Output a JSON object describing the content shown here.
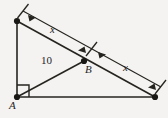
{
  "figure": {
    "background_color": "#f4f3f1",
    "stroke_color": "#26241f",
    "labels": {
      "segment_upper": "x",
      "segment_lower": "x",
      "median_length": "10",
      "point_b": "B",
      "point_a": "A"
    },
    "points": {
      "apex": {
        "x": 17,
        "y": 21
      },
      "right_angle": {
        "x": 17,
        "y": 97
      },
      "base_right": {
        "x": 155,
        "y": 97
      },
      "midpoint_b": {
        "x": 84,
        "y": 61
      }
    },
    "dimension_line": {
      "start": {
        "x": 23,
        "y": 11
      },
      "end": {
        "x": 161,
        "y": 87
      },
      "tick_mid": {
        "x": 92,
        "y": 49
      }
    },
    "right_angle_marker": {
      "size": 12
    }
  }
}
